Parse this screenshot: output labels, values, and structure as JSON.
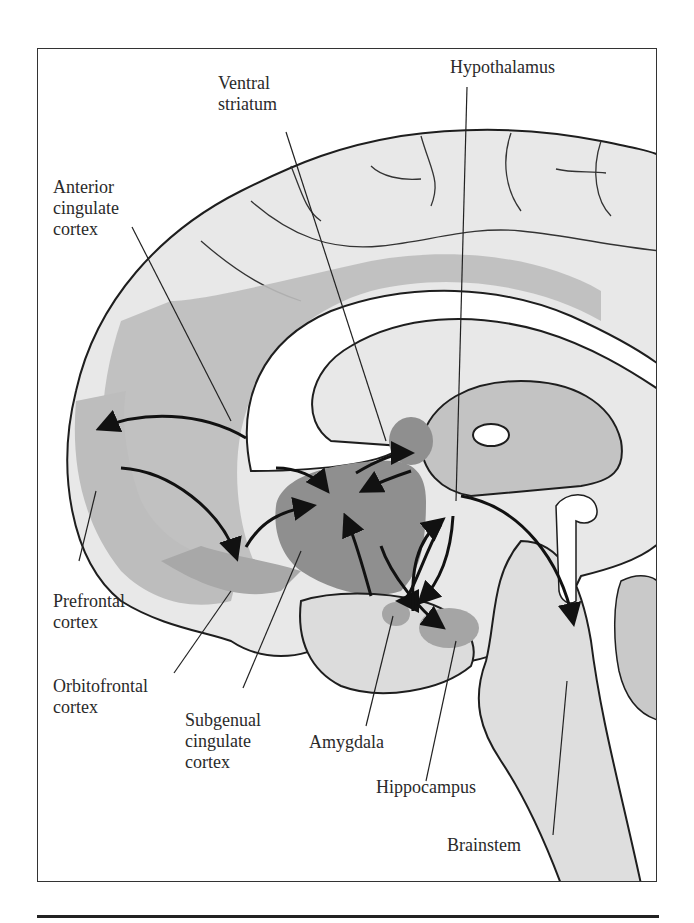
{
  "figure": {
    "labels": {
      "hypothalamus": [
        "Hypothalamus"
      ],
      "ventral_striatum": [
        "Ventral",
        "striatum"
      ],
      "anterior_cingulate": [
        "Anterior",
        "cingulate",
        "cortex"
      ],
      "prefrontal": [
        "Prefrontal",
        "cortex"
      ],
      "orbitofrontal": [
        "Orbitofrontal",
        "cortex"
      ],
      "subgenual": [
        "Subgenual",
        "cingulate",
        "cortex"
      ],
      "amygdala": [
        "Amygdala"
      ],
      "hippocampus": [
        "Hippocampus"
      ],
      "brainstem": [
        "Brainstem"
      ]
    },
    "colors": {
      "cortex_light": "#e6e6e6",
      "region_mid": "#b9b9b9",
      "region_dark": "#8f8f8f",
      "outline": "#1e1e1e",
      "white_matter": "#ffffff"
    }
  }
}
